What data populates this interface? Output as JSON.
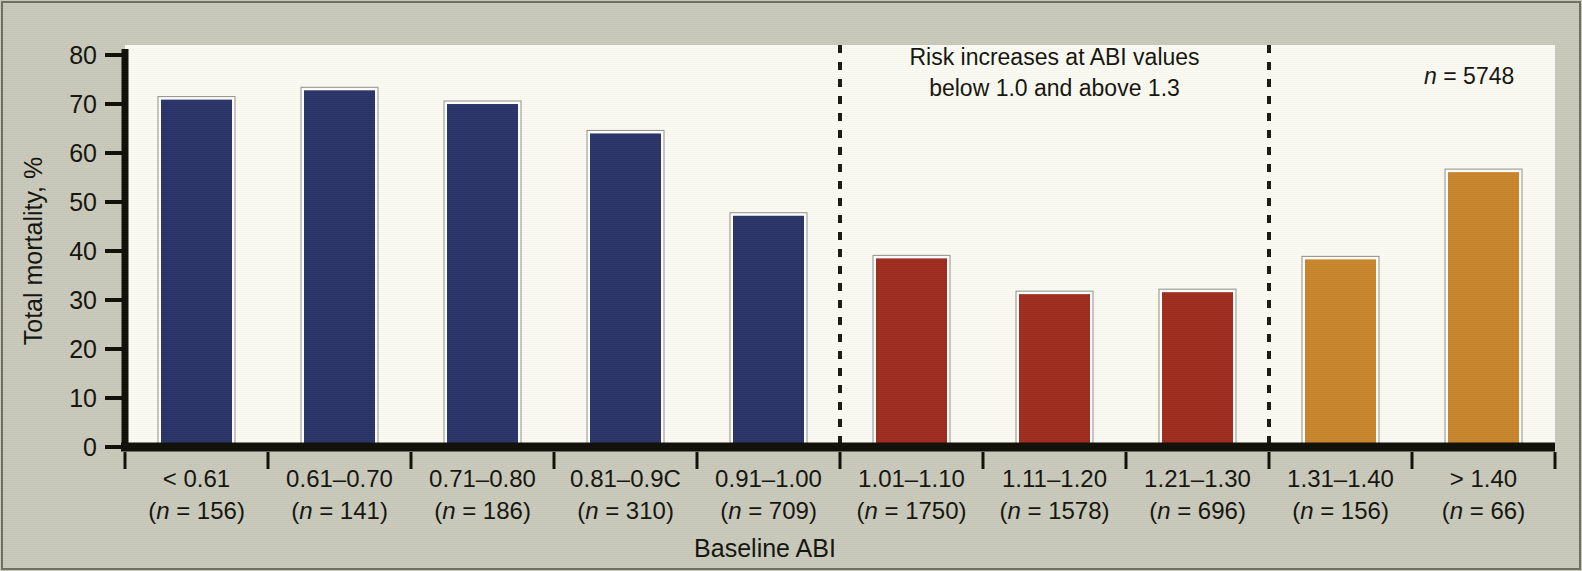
{
  "figure": {
    "background_color": "#c9c9bb",
    "plot_background_color": "#fbfaf2",
    "axis_color": "#101008",
    "divider_style": "dashed"
  },
  "chart_data": {
    "type": "bar",
    "title": "",
    "xlabel": "Baseline ABI",
    "ylabel": "Total mortality, %",
    "ylim": [
      0,
      80
    ],
    "yticks": [
      0,
      10,
      20,
      30,
      40,
      50,
      60,
      70,
      80
    ],
    "ytick_labels": [
      "0",
      "10",
      "20",
      "30",
      "40",
      "50",
      "60",
      "70",
      "80"
    ],
    "grid": false,
    "legend": null,
    "categories": [
      "< 0.61",
      "0.61–0.70",
      "0.71–0.80",
      "0.81–0.9C",
      "0.91–1.00",
      "1.01–1.10",
      "1.11–1.20",
      "1.21–1.30",
      "1.31–1.40",
      "> 1.40"
    ],
    "category_sublabels": [
      "(n = 156)",
      "(n = 141)",
      "(n = 186)",
      "(n = 310)",
      "(n = 709)",
      "(n = 1750)",
      "(n = 1578)",
      "(n = 696)",
      "(n = 156)",
      "(n = 66)"
    ],
    "category_counts": [
      156,
      141,
      186,
      310,
      709,
      1750,
      1578,
      696,
      156,
      66
    ],
    "values": [
      71.2,
      73.1,
      70.3,
      64.3,
      47.5,
      38.8,
      31.5,
      31.9,
      38.6,
      56.4
    ],
    "bar_colors": [
      "#2b3468",
      "#2b3468",
      "#2b3468",
      "#2b3468",
      "#2b3468",
      "#9d2c1e",
      "#9d2c1e",
      "#9d2c1e",
      "#c8862c",
      "#c8862c"
    ],
    "groups": [
      {
        "name": "ABI below 1.0",
        "color": "#2b3468",
        "category_indices": [
          0,
          1,
          2,
          3,
          4
        ]
      },
      {
        "name": "ABI 1.01 to 1.30",
        "color": "#9d2c1e",
        "category_indices": [
          5,
          6,
          7
        ]
      },
      {
        "name": "ABI above 1.30",
        "color": "#c8862c",
        "category_indices": [
          8,
          9
        ]
      }
    ],
    "dividers_after_category": [
      4,
      7
    ],
    "annotations": [
      {
        "name": "risk-note",
        "lines": [
          "Risk increases at ABI values",
          "below 1.0 and above 1.3"
        ],
        "x_category_center": 6,
        "y_value": 78
      },
      {
        "name": "total-n",
        "lines": [
          "n = 5748"
        ],
        "italic_prefix": "n",
        "x_category_center": 8.9,
        "y_value": 74
      }
    ]
  },
  "annotation_text": {
    "risk_line_1": "Risk increases at ABI values",
    "risk_line_2": "below 1.0 and above 1.3",
    "total_n_italic": "n",
    "total_n_rest": " = 5748"
  }
}
